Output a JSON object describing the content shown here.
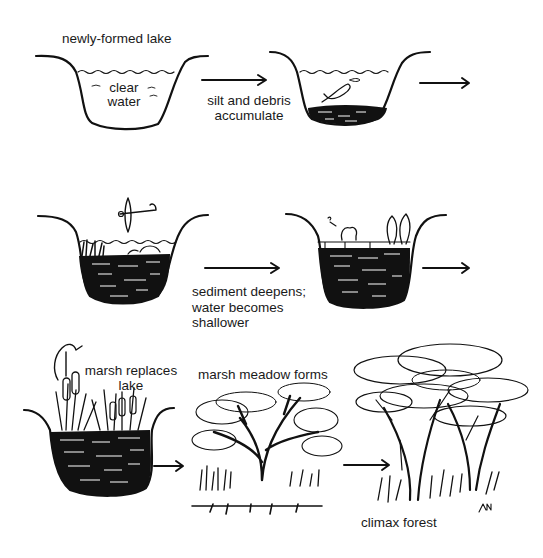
{
  "diagram": {
    "type": "ecological-succession",
    "stages": [
      {
        "id": "stage-1",
        "label": "newly-formed lake",
        "inner_label_lines": [
          "clear",
          "water"
        ]
      },
      {
        "id": "stage-2",
        "transition_label_lines": [
          "silt and debris",
          "accumulate"
        ]
      },
      {
        "id": "stage-3",
        "transition_label_lines": [
          "sediment deepens;",
          "water becomes",
          "shallower"
        ]
      },
      {
        "id": "stage-4"
      },
      {
        "id": "stage-5",
        "label_lines": [
          "marsh replaces",
          "lake"
        ]
      },
      {
        "id": "stage-6",
        "label": "marsh meadow forms"
      },
      {
        "id": "stage-7",
        "label": "climax forest"
      }
    ],
    "signature": "AN",
    "ink_color": "#111111",
    "background_color": "#ffffff"
  }
}
